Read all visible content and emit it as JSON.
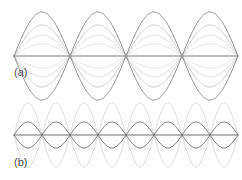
{
  "figure": {
    "type": "standing-wave-diagram",
    "background_color": "#ffffff",
    "width": 242,
    "height": 180,
    "panels": [
      {
        "id": "panel-a",
        "label": "(a)",
        "label_x": 14,
        "label_y": 76,
        "description": "Fundamental standing wave mode, successive time snapshots",
        "axis": {
          "y": 56,
          "x_start": 14,
          "x_end": 238,
          "color": "#7d7d7d",
          "width": 1.1
        },
        "mode_half_cycles": 2,
        "wavelength_px": 112,
        "phase_offset": 0,
        "curves": [
          {
            "amplitude": 44,
            "color": "#8e8e8e",
            "width": 1.0,
            "name": "amplitude-envelope-max"
          },
          {
            "amplitude": 31,
            "color": "#c2c2c2",
            "width": 0.9,
            "name": "amplitude-snapshot-2"
          },
          {
            "amplitude": 21,
            "color": "#d2d2d2",
            "width": 0.9,
            "name": "amplitude-snapshot-3"
          },
          {
            "amplitude": 12,
            "color": "#dcdcdc",
            "width": 0.9,
            "name": "amplitude-snapshot-4"
          }
        ]
      },
      {
        "id": "panel-b",
        "label": "(b)",
        "label_x": 14,
        "label_y": 166,
        "description": "Second harmonic standing wave, two opposing phase snapshots",
        "axis": {
          "y": 135,
          "x_start": 14,
          "x_end": 238,
          "color": "#6e6e6e",
          "width": 1.1
        },
        "mode_half_cycles": 4,
        "wavelength_px": 112,
        "phase_offset": 0,
        "curves": [
          {
            "amplitude": 32,
            "color": "#dcdcdc",
            "width": 1.0,
            "name": "amplitude-envelope-max",
            "invert": false
          },
          {
            "amplitude": 13,
            "color": "#6e6e6e",
            "width": 1.0,
            "name": "amplitude-snapshot-dark",
            "invert": false
          }
        ]
      }
    ]
  },
  "chart_data": {
    "type": "line",
    "title": "",
    "xlabel": "",
    "ylabel": "",
    "grid": false,
    "legend": "none",
    "subplots": [
      {
        "label": "(a)",
        "mode": "fundamental",
        "half_cycles": 2,
        "series": [
          {
            "name": "snapshot-1",
            "relative_amplitude": 1.0,
            "color": "#8e8e8e"
          },
          {
            "name": "snapshot-2",
            "relative_amplitude": 0.7,
            "color": "#c2c2c2"
          },
          {
            "name": "snapshot-3",
            "relative_amplitude": 0.48,
            "color": "#d2d2d2"
          },
          {
            "name": "snapshot-4",
            "relative_amplitude": 0.27,
            "color": "#dcdcdc"
          }
        ],
        "nodes_x": [
          14,
          70,
          126,
          182,
          238
        ],
        "antinodes_x": [
          42,
          98,
          154,
          210
        ]
      },
      {
        "label": "(b)",
        "mode": "second-harmonic",
        "half_cycles": 4,
        "series": [
          {
            "name": "snapshot-large",
            "relative_amplitude": 1.0,
            "color": "#dcdcdc"
          },
          {
            "name": "snapshot-small",
            "relative_amplitude": 0.41,
            "color": "#6e6e6e"
          }
        ],
        "nodes_x": [
          14,
          70,
          126,
          182,
          238
        ],
        "antinodes_x": [
          42,
          98,
          154,
          210
        ]
      }
    ]
  }
}
